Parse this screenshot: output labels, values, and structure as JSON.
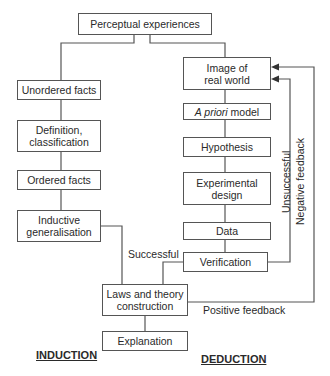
{
  "diagram": {
    "top": "Perceptual experiences",
    "induction_chain": [
      "Unordered facts",
      "Definition, classification",
      "Ordered facts",
      "Inductive generalisation"
    ],
    "deduction_chain": [
      "Image of real world",
      "model",
      "Hypothesis",
      "Experimental design",
      "Data",
      "Verification"
    ],
    "a_priori_italic": "A priori",
    "laws": "Laws and theory construction",
    "explanation": "Explanation",
    "edge_labels": {
      "successful": "Successful",
      "unsuccessful": "Unsuccessful",
      "negative_feedback": "Negative feedback",
      "positive_feedback": "Positive feedback"
    },
    "headings": {
      "induction": "INDUCTION",
      "deduction": "DEDUCTION"
    }
  }
}
